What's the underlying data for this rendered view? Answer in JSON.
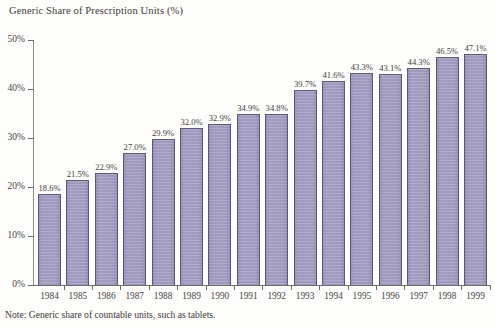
{
  "chart_title": "Generic Share of Prescription Units (%)",
  "footnote": "Note: Generic share of countable units, such as tablets.",
  "colors": {
    "bar_fill": "#a8a1c6",
    "bar_border": "#5c5872",
    "axis": "#6e6c6a",
    "text": "#3b3936"
  },
  "chart_data": {
    "type": "bar",
    "title": "Generic Share of Prescription Units (%)",
    "xlabel": "",
    "ylabel": "",
    "ylim": [
      0,
      50
    ],
    "ytick_labels": [
      "0%",
      "10%",
      "20%",
      "30%",
      "40%",
      "50%"
    ],
    "yticks": [
      0,
      10,
      20,
      30,
      40,
      50
    ],
    "grid": false,
    "legend": "none",
    "categories": [
      "1984",
      "1985",
      "1986",
      "1987",
      "1988",
      "1989",
      "1990",
      "1991",
      "1992",
      "1993",
      "1994",
      "1995",
      "1996",
      "1997",
      "1998",
      "1999"
    ],
    "values": [
      18.6,
      21.5,
      22.9,
      27.0,
      29.9,
      32.0,
      32.9,
      34.9,
      34.8,
      39.7,
      41.6,
      43.3,
      43.1,
      44.3,
      46.5,
      47.1
    ],
    "value_labels": [
      "18.6%",
      "21.5%",
      "22.9%",
      "27.0%",
      "29.9%",
      "32.0%",
      "32.9%",
      "34.9%",
      "34.8%",
      "39.7%",
      "41.6%",
      "43.3%",
      "43.1%",
      "44.3%",
      "46.5%",
      "47.1%"
    ],
    "annotations": [
      "Note: Generic share of countable units, such as tablets."
    ]
  }
}
